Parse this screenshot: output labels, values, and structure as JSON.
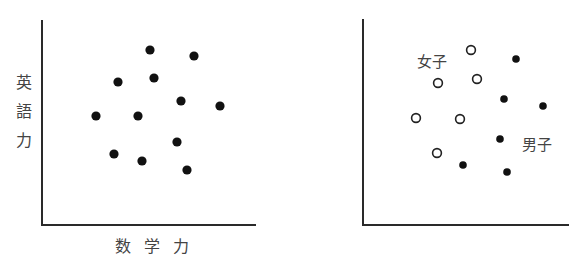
{
  "chart_data": [
    {
      "type": "scatter",
      "title": "",
      "xlabel": "数学力",
      "ylabel": "英語力",
      "grid": false,
      "legend": null,
      "note": "Coordinates in plot pixel space (x right from y-axis, y up from x-axis), axes unlabeled ticks",
      "series": [
        {
          "name": "all",
          "marker": "filled-circle",
          "points": [
            [
              108,
              175
            ],
            [
              152,
              169
            ],
            [
              76,
              143
            ],
            [
              112,
              147
            ],
            [
              139,
              124
            ],
            [
              178,
              119
            ],
            [
              54,
              109
            ],
            [
              96,
              109
            ],
            [
              135,
              83
            ],
            [
              72,
              71
            ],
            [
              100,
              64
            ],
            [
              145,
              55
            ]
          ]
        }
      ]
    },
    {
      "type": "scatter",
      "title": "",
      "xlabel": "",
      "ylabel": "",
      "grid": false,
      "annotations": [
        "女子",
        "男子"
      ],
      "series": [
        {
          "name": "女子",
          "marker": "open-circle",
          "points": [
            [
              108,
              175
            ],
            [
              75,
              142
            ],
            [
              114,
              146
            ],
            [
              53,
              107
            ],
            [
              97,
              106
            ],
            [
              74,
              72
            ]
          ]
        },
        {
          "name": "男子",
          "marker": "filled-circle",
          "points": [
            [
              153,
              166
            ],
            [
              141,
              126
            ],
            [
              180,
              119
            ],
            [
              137,
              86
            ],
            [
              100,
              60
            ],
            [
              144,
              53
            ]
          ]
        }
      ]
    }
  ],
  "left_chart": {
    "ylabel_chars": [
      "英",
      "語",
      "力"
    ],
    "xlabel_chars": [
      "数",
      "学",
      "力"
    ],
    "dots": [
      {
        "cx": 150,
        "cy": 50
      },
      {
        "cx": 194,
        "cy": 56
      },
      {
        "cx": 118,
        "cy": 82
      },
      {
        "cx": 154,
        "cy": 78
      },
      {
        "cx": 181,
        "cy": 101
      },
      {
        "cx": 220,
        "cy": 106
      },
      {
        "cx": 96,
        "cy": 116
      },
      {
        "cx": 138,
        "cy": 116
      },
      {
        "cx": 177,
        "cy": 142
      },
      {
        "cx": 114,
        "cy": 154
      },
      {
        "cx": 142,
        "cy": 161
      },
      {
        "cx": 187,
        "cy": 170
      }
    ]
  },
  "right_chart": {
    "label_girls": "女子",
    "label_boys": "男子",
    "girls": [
      {
        "cx": 471,
        "cy": 50
      },
      {
        "cx": 438,
        "cy": 83
      },
      {
        "cx": 477,
        "cy": 79
      },
      {
        "cx": 416,
        "cy": 118
      },
      {
        "cx": 460,
        "cy": 119
      },
      {
        "cx": 437,
        "cy": 153
      }
    ],
    "boys": [
      {
        "cx": 516,
        "cy": 59
      },
      {
        "cx": 504,
        "cy": 99
      },
      {
        "cx": 543,
        "cy": 106
      },
      {
        "cx": 500,
        "cy": 139
      },
      {
        "cx": 463,
        "cy": 165
      },
      {
        "cx": 507,
        "cy": 172
      }
    ]
  }
}
